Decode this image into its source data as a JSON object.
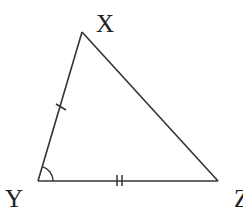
{
  "diagram": {
    "type": "triangle",
    "vertices": {
      "X": {
        "label": "X",
        "x": 82,
        "y": 32
      },
      "Y": {
        "label": "Y",
        "x": 38,
        "y": 181
      },
      "Z": {
        "label": "Z",
        "x": 218,
        "y": 181
      }
    },
    "edges": [
      {
        "from": "X",
        "to": "Y",
        "tick_marks": 1
      },
      {
        "from": "Y",
        "to": "Z",
        "tick_marks": 2
      },
      {
        "from": "Z",
        "to": "X",
        "tick_marks": 0
      }
    ],
    "angle_marks": [
      {
        "vertex": "Y",
        "arcs": 1
      }
    ],
    "colors": {
      "stroke": "#333333",
      "label": "#222222",
      "background": "#ffffff"
    }
  }
}
